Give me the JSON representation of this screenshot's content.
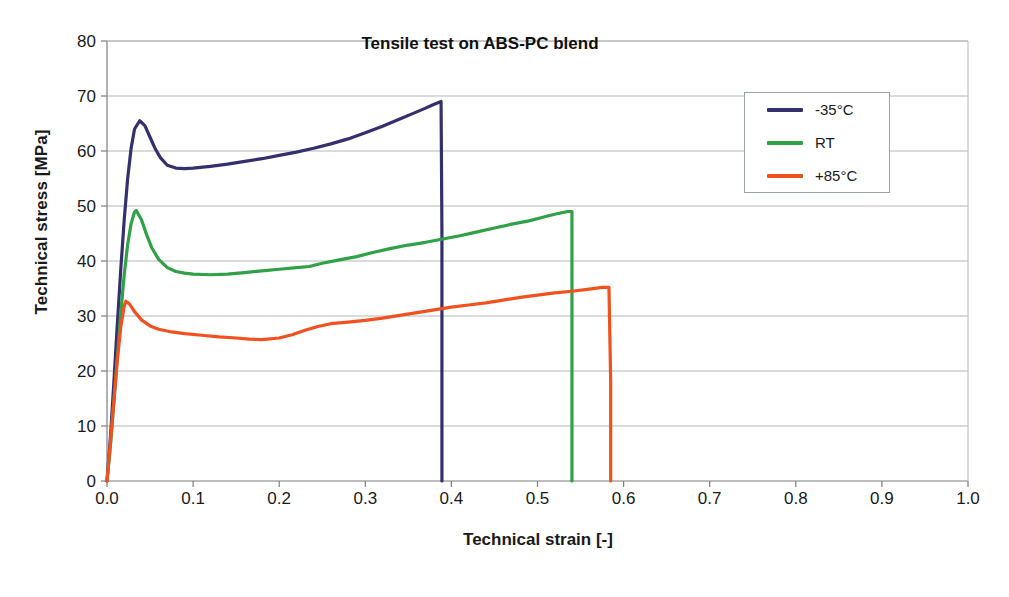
{
  "chart_data": {
    "type": "line",
    "title": "Tensile test on ABS-PC blend",
    "xlabel": "Technical strain [-]",
    "ylabel": "Technical stress [MPa]",
    "xlim": [
      0.0,
      1.0
    ],
    "ylim": [
      0,
      80
    ],
    "xticks": [
      "0.0",
      "0.1",
      "0.2",
      "0.3",
      "0.4",
      "0.5",
      "0.6",
      "0.7",
      "0.8",
      "0.9",
      "1.0"
    ],
    "xtick_values": [
      0.0,
      0.1,
      0.2,
      0.3,
      0.4,
      0.5,
      0.6,
      0.7,
      0.8,
      0.9,
      1.0
    ],
    "yticks": [
      "0",
      "10",
      "20",
      "30",
      "40",
      "50",
      "60",
      "70",
      "80"
    ],
    "ytick_values": [
      0,
      10,
      20,
      30,
      40,
      50,
      60,
      70,
      80
    ],
    "grid": "horizontal",
    "legend_position": "upper-right-inside",
    "series": [
      {
        "name": "-35°C",
        "color": "#34306e",
        "yield_strain": 0.038,
        "yield_stress": 65.5,
        "break_strain": 0.389,
        "break_stress": 69.0,
        "points": [
          [
            0.0,
            0.0
          ],
          [
            0.004,
            8.0
          ],
          [
            0.008,
            18.0
          ],
          [
            0.012,
            28.5
          ],
          [
            0.016,
            38.5
          ],
          [
            0.02,
            47.5
          ],
          [
            0.024,
            55.0
          ],
          [
            0.028,
            60.5
          ],
          [
            0.032,
            64.0
          ],
          [
            0.038,
            65.5
          ],
          [
            0.044,
            64.6
          ],
          [
            0.05,
            62.5
          ],
          [
            0.056,
            60.4
          ],
          [
            0.062,
            58.8
          ],
          [
            0.07,
            57.4
          ],
          [
            0.08,
            56.9
          ],
          [
            0.09,
            56.8
          ],
          [
            0.1,
            56.9
          ],
          [
            0.12,
            57.2
          ],
          [
            0.14,
            57.6
          ],
          [
            0.16,
            58.1
          ],
          [
            0.18,
            58.6
          ],
          [
            0.2,
            59.2
          ],
          [
            0.22,
            59.8
          ],
          [
            0.24,
            60.5
          ],
          [
            0.26,
            61.3
          ],
          [
            0.28,
            62.2
          ],
          [
            0.3,
            63.3
          ],
          [
            0.32,
            64.5
          ],
          [
            0.34,
            65.8
          ],
          [
            0.355,
            66.8
          ],
          [
            0.37,
            67.8
          ],
          [
            0.38,
            68.5
          ],
          [
            0.388,
            69.0
          ],
          [
            0.389,
            45.0
          ],
          [
            0.389,
            20.0
          ],
          [
            0.389,
            0.0
          ]
        ]
      },
      {
        "name": "RT",
        "color": "#2fa146",
        "yield_strain": 0.034,
        "yield_stress": 49.2,
        "break_strain": 0.54,
        "break_stress": 49.0,
        "points": [
          [
            0.0,
            0.0
          ],
          [
            0.004,
            6.5
          ],
          [
            0.008,
            14.5
          ],
          [
            0.012,
            22.5
          ],
          [
            0.016,
            30.5
          ],
          [
            0.02,
            37.5
          ],
          [
            0.024,
            43.0
          ],
          [
            0.028,
            46.8
          ],
          [
            0.032,
            48.9
          ],
          [
            0.034,
            49.2
          ],
          [
            0.04,
            47.5
          ],
          [
            0.046,
            44.8
          ],
          [
            0.052,
            42.4
          ],
          [
            0.06,
            40.3
          ],
          [
            0.07,
            38.8
          ],
          [
            0.08,
            38.1
          ],
          [
            0.09,
            37.8
          ],
          [
            0.1,
            37.6
          ],
          [
            0.12,
            37.5
          ],
          [
            0.14,
            37.6
          ],
          [
            0.16,
            37.9
          ],
          [
            0.18,
            38.2
          ],
          [
            0.2,
            38.5
          ],
          [
            0.22,
            38.8
          ],
          [
            0.235,
            39.0
          ],
          [
            0.25,
            39.6
          ],
          [
            0.27,
            40.2
          ],
          [
            0.29,
            40.8
          ],
          [
            0.31,
            41.6
          ],
          [
            0.33,
            42.3
          ],
          [
            0.35,
            42.9
          ],
          [
            0.37,
            43.4
          ],
          [
            0.39,
            44.0
          ],
          [
            0.41,
            44.6
          ],
          [
            0.43,
            45.3
          ],
          [
            0.45,
            46.0
          ],
          [
            0.47,
            46.7
          ],
          [
            0.49,
            47.3
          ],
          [
            0.505,
            47.9
          ],
          [
            0.52,
            48.5
          ],
          [
            0.535,
            49.0
          ],
          [
            0.54,
            49.0
          ],
          [
            0.54,
            25.0
          ],
          [
            0.54,
            0.0
          ]
        ]
      },
      {
        "name": "+85°C",
        "color": "#f0511f",
        "yield_strain": 0.022,
        "yield_stress": 32.7,
        "break_strain": 0.585,
        "break_stress": 35.2,
        "points": [
          [
            0.0,
            0.0
          ],
          [
            0.004,
            7.0
          ],
          [
            0.008,
            14.5
          ],
          [
            0.012,
            22.0
          ],
          [
            0.016,
            28.0
          ],
          [
            0.02,
            31.8
          ],
          [
            0.022,
            32.7
          ],
          [
            0.026,
            32.2
          ],
          [
            0.032,
            30.8
          ],
          [
            0.04,
            29.3
          ],
          [
            0.05,
            28.2
          ],
          [
            0.06,
            27.6
          ],
          [
            0.075,
            27.1
          ],
          [
            0.09,
            26.8
          ],
          [
            0.11,
            26.5
          ],
          [
            0.13,
            26.2
          ],
          [
            0.15,
            26.0
          ],
          [
            0.165,
            25.8
          ],
          [
            0.18,
            25.7
          ],
          [
            0.2,
            26.0
          ],
          [
            0.215,
            26.6
          ],
          [
            0.23,
            27.4
          ],
          [
            0.245,
            28.1
          ],
          [
            0.26,
            28.6
          ],
          [
            0.28,
            28.9
          ],
          [
            0.3,
            29.2
          ],
          [
            0.32,
            29.6
          ],
          [
            0.34,
            30.1
          ],
          [
            0.36,
            30.6
          ],
          [
            0.38,
            31.1
          ],
          [
            0.4,
            31.6
          ],
          [
            0.42,
            32.0
          ],
          [
            0.44,
            32.4
          ],
          [
            0.46,
            32.9
          ],
          [
            0.48,
            33.4
          ],
          [
            0.5,
            33.8
          ],
          [
            0.52,
            34.2
          ],
          [
            0.54,
            34.5
          ],
          [
            0.56,
            34.9
          ],
          [
            0.575,
            35.2
          ],
          [
            0.583,
            35.2
          ],
          [
            0.585,
            18.0
          ],
          [
            0.585,
            0.0
          ]
        ]
      }
    ]
  },
  "legend": {
    "items": [
      {
        "label": "-35°C",
        "color": "#34306e"
      },
      {
        "label": "RT",
        "color": "#2fa146"
      },
      {
        "label": "+85°C",
        "color": "#f0511f"
      }
    ]
  },
  "caption": {
    "text": ""
  }
}
